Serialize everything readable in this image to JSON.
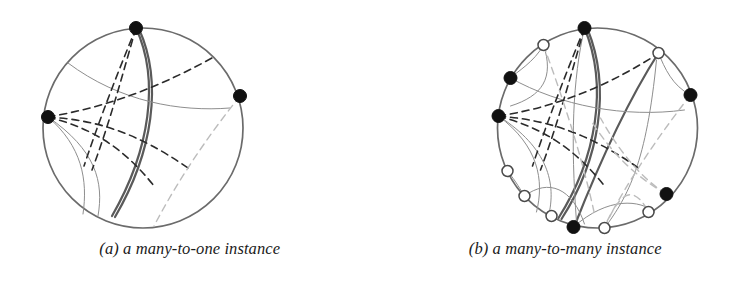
{
  "figure": {
    "panels": [
      {
        "id": "panel-a",
        "caption": "(a) a many-to-one instance",
        "circle": {
          "cx": 143,
          "cy": 128,
          "r": 100
        },
        "node_radius_filled": 6.5,
        "node_radius_hollow": 5.5,
        "nodes": [
          {
            "id": "a-top",
            "x": 136,
            "y": 28,
            "type": "filled"
          },
          {
            "id": "a-right",
            "x": 240,
            "y": 96,
            "type": "filled"
          },
          {
            "id": "a-left",
            "x": 48,
            "y": 117,
            "type": "filled"
          }
        ],
        "arcs": [
          {
            "id": "a-arc-thick-main",
            "style": "solid-thick",
            "d": "M 136 28 C 160 80 150 150 112 216"
          },
          {
            "id": "a-arc-thick-dup",
            "style": "solid-thick",
            "d": "M 139 29 C 163 82 153 152 115 217"
          },
          {
            "id": "a-arc-thin-upper",
            "style": "solid-thin",
            "d": "M 68 63 C 120 102 180 112 230 108"
          },
          {
            "id": "a-arc-thin-left",
            "style": "solid-thin",
            "d": "M 48 117 C 96 150 104 182 98 216"
          },
          {
            "id": "a-arc-thin-left2",
            "style": "solid-thin",
            "d": "M 48 117 C 82 146 88 180 83 214"
          },
          {
            "id": "a-dash-lt-1",
            "style": "dashed-dark",
            "d": "M 136 28 C 122 76 110 122 92 170"
          },
          {
            "id": "a-dash-lt-2",
            "style": "dashed-dark",
            "d": "M 136 28 C 118 72 100 118 84 166"
          },
          {
            "id": "a-dash-le-1",
            "style": "dashed-dark",
            "d": "M 48 117 C 100 108 150 92 212 58"
          },
          {
            "id": "a-dash-le-2",
            "style": "dashed-dark",
            "d": "M 48 117 C 96 120 136 132 188 168"
          },
          {
            "id": "a-dash-le-3",
            "style": "dashed-dark",
            "d": "M 48 117 C 92 128 124 148 154 186"
          },
          {
            "id": "a-dash-light-r",
            "style": "dashed-light",
            "d": "M 240 96 C 208 136 178 180 154 226"
          }
        ]
      },
      {
        "id": "panel-b",
        "caption": "(b) a many-to-many instance",
        "circle": {
          "cx": 597,
          "cy": 128,
          "r": 100
        },
        "node_radius_filled": 6.5,
        "node_radius_hollow": 5.5,
        "nodes": [
          {
            "id": "b-n1",
            "x": 584,
            "y": 28,
            "type": "filled"
          },
          {
            "id": "b-n2",
            "x": 543,
            "y": 45,
            "type": "hollow"
          },
          {
            "id": "b-n3",
            "x": 510,
            "y": 78,
            "type": "filled"
          },
          {
            "id": "b-n4",
            "x": 498,
            "y": 116,
            "type": "filled"
          },
          {
            "id": "b-n5",
            "x": 507,
            "y": 171,
            "type": "hollow"
          },
          {
            "id": "b-n6",
            "x": 524,
            "y": 196,
            "type": "hollow"
          },
          {
            "id": "b-n7",
            "x": 551,
            "y": 216,
            "type": "hollow"
          },
          {
            "id": "b-n8",
            "x": 573,
            "y": 227,
            "type": "filled"
          },
          {
            "id": "b-n9",
            "x": 604,
            "y": 228,
            "type": "hollow"
          },
          {
            "id": "b-n10",
            "x": 648,
            "y": 212,
            "type": "hollow"
          },
          {
            "id": "b-n11",
            "x": 666,
            "y": 194,
            "type": "filled"
          },
          {
            "id": "b-n12",
            "x": 690,
            "y": 95,
            "type": "filled"
          },
          {
            "id": "b-n13",
            "x": 658,
            "y": 53,
            "type": "hollow"
          }
        ],
        "arcs": [
          {
            "id": "b-arc-thick-1",
            "style": "solid-thick",
            "d": "M 584 28 C 608 86 596 158 558 218"
          },
          {
            "id": "b-arc-thick-2",
            "style": "solid-thick",
            "d": "M 587 29 C 611 88 599 160 561 219"
          },
          {
            "id": "b-arc-thick-3",
            "style": "solid-thick",
            "d": "M 658 53 C 624 106 596 170 574 226"
          },
          {
            "id": "b-arc-thin-1",
            "style": "solid-thin",
            "d": "M 543 45 C 534 62 516 72 510 78"
          },
          {
            "id": "b-arc-thin-2",
            "style": "solid-thin",
            "d": "M 543 45 C 554 78 542 96 510 106"
          },
          {
            "id": "b-arc-thin-3",
            "style": "solid-thin",
            "d": "M 510 78 C 560 106 624 118 684 110"
          },
          {
            "id": "b-arc-thin-4",
            "style": "solid-thin",
            "d": "M 498 116 C 548 148 556 184 548 216"
          },
          {
            "id": "b-arc-thin-5",
            "style": "solid-thin",
            "d": "M 498 116 C 538 146 544 180 536 212"
          },
          {
            "id": "b-arc-thin-6",
            "style": "solid-thin",
            "d": "M 507 171 C 516 182 520 190 524 196"
          },
          {
            "id": "b-arc-thin-7",
            "style": "solid-thin",
            "d": "M 524 196 C 548 178 572 188 584 224"
          },
          {
            "id": "b-arc-thin-8",
            "style": "solid-thin",
            "d": "M 584 28 C 572 80 570 140 576 222"
          },
          {
            "id": "b-arc-thin-9",
            "style": "solid-thin",
            "d": "M 604 228 C 628 196 646 162 656 60"
          },
          {
            "id": "b-arc-thin-10",
            "style": "solid-thin",
            "d": "M 573 227 C 608 196 640 200 654 212"
          },
          {
            "id": "b-arc-thin-11",
            "style": "solid-thin",
            "d": "M 690 95 C 672 86 664 68 658 53"
          },
          {
            "id": "b-dash-1",
            "style": "dashed-dark",
            "d": "M 584 28 C 570 76 558 122 540 170"
          },
          {
            "id": "b-dash-2",
            "style": "dashed-dark",
            "d": "M 584 28 C 566 72 548 118 532 166"
          },
          {
            "id": "b-dash-3",
            "style": "dashed-dark",
            "d": "M 498 116 C 550 108 600 90 654 56"
          },
          {
            "id": "b-dash-4",
            "style": "dashed-dark",
            "d": "M 498 116 C 546 120 586 132 638 168"
          },
          {
            "id": "b-dash-5",
            "style": "dashed-dark",
            "d": "M 498 116 C 542 128 574 148 604 186"
          },
          {
            "id": "b-dash-light-1",
            "style": "dashed-light",
            "d": "M 690 95 C 658 136 628 180 604 226"
          },
          {
            "id": "b-dash-light-2",
            "style": "dashed-light",
            "d": "M 666 194 C 634 176 612 154 590 120"
          },
          {
            "id": "b-dash-light-3",
            "style": "dashed-light",
            "d": "M 666 194 C 640 178 618 150 600 118"
          },
          {
            "id": "b-dash-light-4",
            "style": "dashed-light",
            "d": "M 543 45 C 560 92 580 150 594 214"
          },
          {
            "id": "b-dash-light-5",
            "style": "dashed-light",
            "d": "M 604 228 C 616 200 630 178 648 212"
          }
        ]
      }
    ]
  },
  "colors": {
    "circle_outline": "#6b6b6b",
    "solid_thick": "#5a5a5a",
    "solid_thin": "#8e8e8e",
    "dashed_dark": "#2b2b2b",
    "dashed_light": "#bcbcbc",
    "node_fill": "#111111",
    "node_hollow_fill": "#ffffff",
    "caption_text": "#1b1b1b",
    "background": "#ffffff"
  }
}
